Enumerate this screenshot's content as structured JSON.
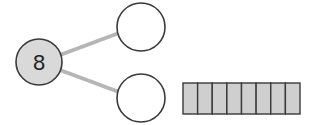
{
  "diagram": {
    "type": "number-bond",
    "whole": {
      "value": "8",
      "fill": "#d9d9d9",
      "stroke": "#3a3a3a"
    },
    "parts": [
      {
        "value": "",
        "fill": "#ffffff"
      },
      {
        "value": "",
        "fill": "#ffffff"
      }
    ],
    "connector_color": "#b5b5b5",
    "tape": {
      "cells": 8,
      "fill": "#cfcfcf",
      "stroke": "#3a3a3a"
    }
  }
}
